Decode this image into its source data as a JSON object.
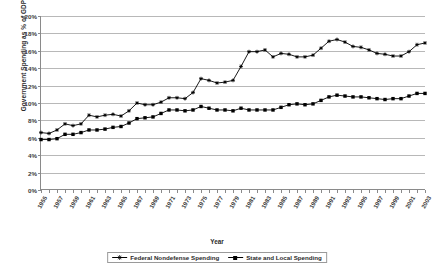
{
  "chart_data": {
    "type": "line",
    "title": "",
    "xlabel": "Year",
    "ylabel": "Government Spending as % of GDP",
    "ylim": [
      0,
      20
    ],
    "ytick_labels": [
      "0%",
      "2%",
      "4%",
      "6%",
      "8%",
      "10%",
      "12%",
      "14%",
      "16%",
      "18%",
      "20%"
    ],
    "ytick_values": [
      0,
      2,
      4,
      6,
      8,
      10,
      12,
      14,
      16,
      18,
      20
    ],
    "grid": true,
    "legend_position": "bottom-center",
    "x": [
      1955,
      1956,
      1957,
      1958,
      1959,
      1960,
      1961,
      1962,
      1963,
      1964,
      1965,
      1966,
      1967,
      1968,
      1969,
      1970,
      1971,
      1972,
      1973,
      1974,
      1975,
      1976,
      1977,
      1978,
      1979,
      1980,
      1981,
      1982,
      1983,
      1984,
      1985,
      1986,
      1987,
      1988,
      1989,
      1990,
      1991,
      1992,
      1993,
      1994,
      1995,
      1996,
      1997,
      1998,
      1999,
      2000,
      2001,
      2002,
      2003
    ],
    "xtick_labels": [
      "1955",
      "1957",
      "1959",
      "1961",
      "1963",
      "1965",
      "1967",
      "1969",
      "1971",
      "1973",
      "1975",
      "1977",
      "1979",
      "1981",
      "1983",
      "1985",
      "1987",
      "1989",
      "1991",
      "1993",
      "1995",
      "1997",
      "1999",
      "2001",
      "2003"
    ],
    "series": [
      {
        "name": "Federal Nondefense Spending",
        "marker": "cross",
        "color": "#000000",
        "values": [
          6.6,
          6.5,
          6.9,
          7.6,
          7.4,
          7.6,
          8.6,
          8.4,
          8.6,
          8.7,
          8.5,
          9.1,
          10.0,
          9.8,
          9.8,
          10.1,
          10.6,
          10.6,
          10.5,
          11.2,
          12.8,
          12.6,
          12.3,
          12.4,
          12.6,
          14.2,
          15.9,
          15.9,
          16.1,
          15.3,
          15.7,
          15.6,
          15.3,
          15.3,
          15.5,
          16.3,
          17.1,
          17.3,
          17.0,
          16.5,
          16.4,
          16.1,
          15.7,
          15.6,
          15.4,
          15.4,
          15.9,
          16.7,
          16.9
        ]
      },
      {
        "name": "State and Local Spending",
        "marker": "square",
        "color": "#000000",
        "values": [
          5.8,
          5.8,
          5.9,
          6.4,
          6.4,
          6.6,
          6.9,
          6.9,
          7.0,
          7.2,
          7.3,
          7.7,
          8.2,
          8.3,
          8.4,
          8.8,
          9.2,
          9.2,
          9.1,
          9.2,
          9.6,
          9.4,
          9.2,
          9.2,
          9.1,
          9.4,
          9.2,
          9.2,
          9.2,
          9.2,
          9.5,
          9.8,
          9.9,
          9.8,
          9.9,
          10.3,
          10.7,
          10.9,
          10.8,
          10.7,
          10.7,
          10.6,
          10.5,
          10.4,
          10.5,
          10.5,
          10.8,
          11.1,
          11.1
        ]
      }
    ]
  }
}
